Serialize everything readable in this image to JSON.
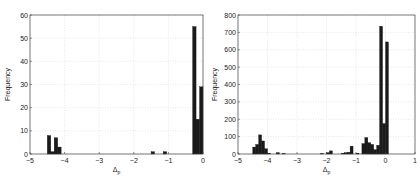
{
  "chart_data": [
    {
      "type": "bar",
      "title": "",
      "xlabel": "Δp",
      "ylabel": "Frequency",
      "xlim": [
        -5,
        0
      ],
      "ylim": [
        0,
        60
      ],
      "xticks": [
        -5,
        -4,
        -3,
        -2,
        -1,
        0
      ],
      "yticks": [
        0,
        10,
        20,
        30,
        40,
        50,
        60
      ],
      "grid": true,
      "bin_width": 0.1,
      "bins": [
        {
          "x": -4.45,
          "count": 8
        },
        {
          "x": -4.35,
          "count": 1
        },
        {
          "x": -4.25,
          "count": 7
        },
        {
          "x": -4.15,
          "count": 3
        },
        {
          "x": -1.45,
          "count": 1
        },
        {
          "x": -1.1,
          "count": 1
        },
        {
          "x": -0.25,
          "count": 55
        },
        {
          "x": -0.15,
          "count": 15
        },
        {
          "x": -0.05,
          "count": 29
        }
      ]
    },
    {
      "type": "bar",
      "title": "",
      "xlabel": "Δp",
      "ylabel": "Frequency",
      "xlim": [
        -5,
        1
      ],
      "ylim": [
        0,
        800
      ],
      "xticks": [
        -5,
        -4,
        -3,
        -2,
        -1,
        0,
        1
      ],
      "yticks": [
        0,
        100,
        200,
        300,
        400,
        500,
        600,
        700,
        800
      ],
      "grid": true,
      "bin_width": 0.1,
      "bins": [
        {
          "x": -4.45,
          "count": 40
        },
        {
          "x": -4.35,
          "count": 55
        },
        {
          "x": -4.25,
          "count": 110
        },
        {
          "x": -4.15,
          "count": 75
        },
        {
          "x": -4.05,
          "count": 30
        },
        {
          "x": -3.95,
          "count": 5
        },
        {
          "x": -3.65,
          "count": 8
        },
        {
          "x": -3.45,
          "count": 3
        },
        {
          "x": -2.15,
          "count": 3
        },
        {
          "x": -1.95,
          "count": 8
        },
        {
          "x": -1.85,
          "count": 18
        },
        {
          "x": -1.45,
          "count": 5
        },
        {
          "x": -1.35,
          "count": 8
        },
        {
          "x": -1.25,
          "count": 10
        },
        {
          "x": -1.15,
          "count": 45
        },
        {
          "x": -0.95,
          "count": 5
        },
        {
          "x": -0.75,
          "count": 60
        },
        {
          "x": -0.65,
          "count": 95
        },
        {
          "x": -0.55,
          "count": 65
        },
        {
          "x": -0.45,
          "count": 55
        },
        {
          "x": -0.35,
          "count": 25
        },
        {
          "x": -0.25,
          "count": 50
        },
        {
          "x": -0.15,
          "count": 735
        },
        {
          "x": -0.05,
          "count": 175
        },
        {
          "x": 0.05,
          "count": 645
        }
      ]
    }
  ]
}
